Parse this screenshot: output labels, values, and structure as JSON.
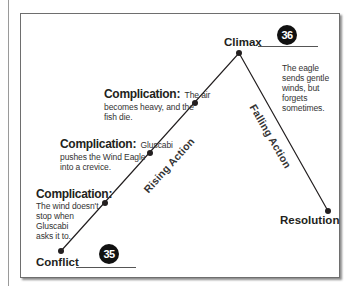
{
  "diagram": {
    "type": "plot-diagram",
    "points": {
      "conflict": {
        "label": "Conflict",
        "page": "35",
        "x": 61,
        "y": 251
      },
      "climax": {
        "label": "Climax",
        "page": "36",
        "x": 239,
        "y": 53
      },
      "resolution": {
        "label": "Resolution",
        "x": 328,
        "y": 211
      }
    },
    "rising_action_label": "Rising Action",
    "falling_action_label": "Falling Action",
    "complications": [
      {
        "heading": "Complication:",
        "text_lines": [
          "The wind doesn't",
          "stop when",
          "Gluscabi",
          "asks it to."
        ],
        "x": 105,
        "y": 203
      },
      {
        "heading": "Complication:",
        "inline": "Gluscabi",
        "text_lines": [
          "pushes the Wind Eagle",
          "into a crevice."
        ],
        "x": 150,
        "y": 153
      },
      {
        "heading": "Complication:",
        "inline": "The air",
        "text_lines": [
          "becomes heavy, and the",
          "fish die."
        ],
        "x": 195,
        "y": 103
      }
    ],
    "falling_note_lines": [
      "The eagle",
      "sends gentle",
      "winds, but",
      "forgets",
      "sometimes."
    ]
  },
  "colors": {
    "line": "#231f20",
    "badge": "#111111",
    "frame": "#6e6e6e"
  }
}
